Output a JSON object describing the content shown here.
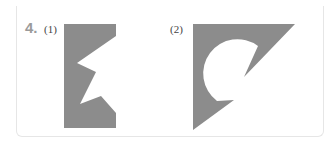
{
  "problem": {
    "number": "4.",
    "parts": [
      {
        "label": "(1)",
        "figure": "rectangle-with-zigzag-notch"
      },
      {
        "label": "(2)",
        "figure": "right-triangle-with-circular-cutout"
      }
    ]
  },
  "colors": {
    "shape_fill": "#8c8c8c",
    "number_color": "#9a9a9a",
    "label_color": "#444444",
    "border_color": "#e6e6e6",
    "background": "#ffffff"
  }
}
